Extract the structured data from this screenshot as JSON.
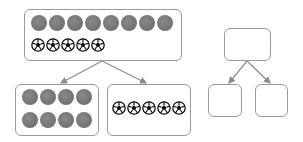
{
  "diagram": {
    "type": "part-whole split",
    "colors": {
      "box_border": "#9a9a9a",
      "arrow": "#8c8c8c",
      "gray_ball": "#777777",
      "soccer_ball": "#111111"
    },
    "left_diagram": {
      "whole": {
        "gray_balls": 8,
        "soccer_balls": 5
      },
      "part_left": {
        "gray_balls": 8,
        "layout": "4x2"
      },
      "part_right": {
        "soccer_balls": 5
      }
    },
    "right_diagram": {
      "whole": {
        "content": ""
      },
      "part_left": {
        "content": ""
      },
      "part_right": {
        "content": ""
      }
    }
  }
}
